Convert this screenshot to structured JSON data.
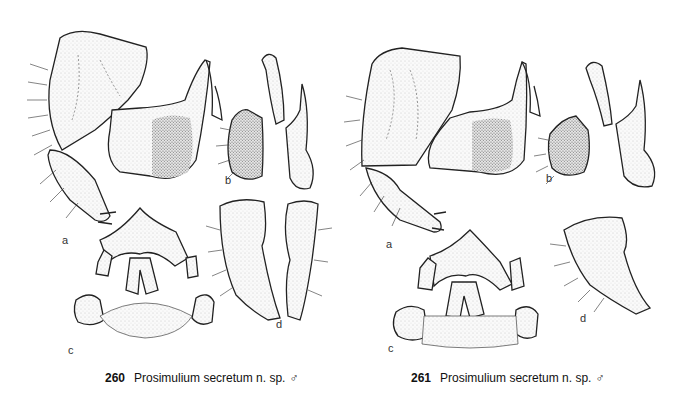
{
  "figures": [
    {
      "number": "260",
      "title": "Prosimulium secretum n. sp.",
      "sex_symbol": "♂",
      "subfigure_labels": [
        "a",
        "b",
        "c",
        "d"
      ],
      "subfigures": [
        {
          "label": "a",
          "description": "gonocoxite and gonostylus, lateral view with ventral plate"
        },
        {
          "label": "b",
          "description": "ventral plate and median sclerite, lateral views"
        },
        {
          "label": "c",
          "description": "ventral plate and paramere, ventral view"
        },
        {
          "label": "d",
          "description": "gonostyli, two views"
        }
      ]
    },
    {
      "number": "261",
      "title": "Prosimulium secretum n. sp.",
      "sex_symbol": "♂",
      "subfigure_labels": [
        "a",
        "b",
        "c",
        "d"
      ],
      "subfigures": [
        {
          "label": "a",
          "description": "gonocoxite and gonostylus, lateral view with ventral plate"
        },
        {
          "label": "b",
          "description": "ventral plate and median sclerite, lateral views"
        },
        {
          "label": "c",
          "description": "ventral plate and paramere, ventral view"
        },
        {
          "label": "d",
          "description": "gonostylus"
        }
      ]
    }
  ]
}
